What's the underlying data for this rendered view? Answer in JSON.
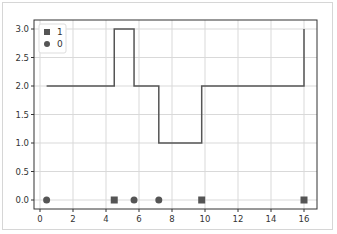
{
  "chart_data": {
    "type": "line",
    "title": "",
    "xlabel": "",
    "ylabel": "",
    "xlim": [
      -0.7,
      16.9
    ],
    "ylim": [
      -0.15,
      3.15
    ],
    "grid": true,
    "legend_position": "upper left",
    "x_ticks": [
      "0",
      "2",
      "4",
      "6",
      "8",
      "10",
      "12",
      "14",
      "16"
    ],
    "y_ticks": [
      "0.0",
      "0.5",
      "1.0",
      "1.5",
      "2.0",
      "2.5",
      "3.0"
    ],
    "legend": [
      {
        "label": "1",
        "marker": "square"
      },
      {
        "label": "0",
        "marker": "circle"
      }
    ],
    "step_series": {
      "name": "state",
      "x": [
        0.4,
        4.5,
        4.5,
        5.7,
        5.7,
        7.2,
        7.2,
        9.8,
        9.8,
        16.0,
        16.0
      ],
      "y": [
        2,
        2,
        3,
        3,
        2,
        2,
        1,
        1,
        2,
        2,
        3
      ]
    },
    "series": [
      {
        "name": "1",
        "marker": "square",
        "x": [
          4.5,
          9.8,
          16.0
        ],
        "y": [
          0,
          0,
          0
        ]
      },
      {
        "name": "0",
        "marker": "circle",
        "x": [
          0.4,
          5.7,
          7.2
        ],
        "y": [
          0,
          0,
          0
        ]
      }
    ]
  },
  "colors": {
    "line": "#555555",
    "marker": "#555555",
    "grid": "#d9d9d9",
    "axes": "#333333"
  }
}
